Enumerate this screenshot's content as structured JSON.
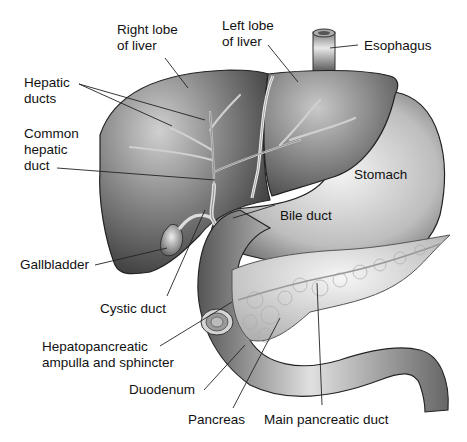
{
  "diagram": {
    "labels": {
      "right_lobe": "Right lobe\nof liver",
      "left_lobe": "Left lobe\nof liver",
      "esophagus": "Esophagus",
      "hepatic_ducts": "Hepatic\nducts",
      "common_hepatic_duct": "Common\nhepatic\nduct",
      "stomach": "Stomach",
      "bile_duct": "Bile duct",
      "gallbladder": "Gallbladder",
      "cystic_duct": "Cystic duct",
      "hepatopancreatic": "Hepatopancreatic\nampulla and sphincter",
      "duodenum": "Duodenum",
      "pancreas": "Pancreas",
      "main_pancreatic_duct": "Main pancreatic duct"
    },
    "colors": {
      "organ_dark": "#3a3a3a",
      "organ_mid": "#8a8a8a",
      "organ_light": "#d8d8d8",
      "leader_line": "#222222",
      "text": "#111111"
    }
  }
}
